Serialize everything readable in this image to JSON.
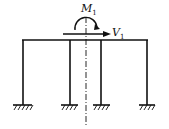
{
  "diagram": {
    "type": "structural-frame",
    "labels": {
      "moment": {
        "symbol": "M",
        "subscript": "1"
      },
      "shear": {
        "symbol": "V",
        "subscript": "1"
      }
    },
    "columns": 4,
    "supports": "fixed",
    "symmetry_axis": true,
    "colors": {
      "line": "#111111",
      "background": "#ffffff"
    }
  }
}
